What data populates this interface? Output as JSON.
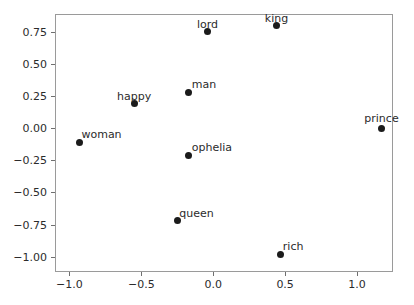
{
  "chart_data": {
    "type": "scatter",
    "title": "",
    "xlabel": "",
    "ylabel": "",
    "xlim": [
      -1.1,
      1.25
    ],
    "ylim": [
      -1.12,
      0.89
    ],
    "grid": false,
    "legend": null,
    "marker_color": "#1b1b1b",
    "marker_size_px": 7,
    "xticks": [
      -1.0,
      -0.5,
      0.0,
      0.5,
      1.0
    ],
    "xticklabels": [
      "−1.0",
      "−0.5",
      "0.0",
      "0.5",
      "1.0"
    ],
    "yticks": [
      0.75,
      0.5,
      0.25,
      0.0,
      -0.25,
      -0.5,
      -0.75,
      -1.0
    ],
    "yticklabels": [
      "0.75",
      "0.50",
      "0.25",
      "0.00",
      "−0.25",
      "−0.50",
      "−0.75",
      "−1.00"
    ],
    "points": [
      {
        "label": "king",
        "x": 0.44,
        "y": 0.8,
        "label_dx": 0,
        "label_dy": -13,
        "label_align": "center"
      },
      {
        "label": "lord",
        "x": -0.04,
        "y": 0.75,
        "label_dx": 0,
        "label_dy": -13,
        "label_align": "center"
      },
      {
        "label": "man",
        "x": -0.17,
        "y": 0.28,
        "label_dx": 3,
        "label_dy": -13,
        "label_align": "left"
      },
      {
        "label": "happy",
        "x": -0.55,
        "y": 0.19,
        "label_dx": 0,
        "label_dy": -13,
        "label_align": "center"
      },
      {
        "label": "woman",
        "x": -0.93,
        "y": -0.11,
        "label_dx": 2,
        "label_dy": -13,
        "label_align": "left"
      },
      {
        "label": "prince",
        "x": 1.17,
        "y": 0.0,
        "label_dx": 0,
        "label_dy": -15,
        "label_align": "center"
      },
      {
        "label": "ophelia",
        "x": -0.17,
        "y": -0.21,
        "label_dx": 3,
        "label_dy": -13,
        "label_align": "left"
      },
      {
        "label": "queen",
        "x": -0.25,
        "y": -0.72,
        "label_dx": 2,
        "label_dy": -13,
        "label_align": "left"
      },
      {
        "label": "rich",
        "x": 0.47,
        "y": -0.98,
        "label_dx": 2,
        "label_dy": -13,
        "label_align": "left"
      }
    ]
  }
}
